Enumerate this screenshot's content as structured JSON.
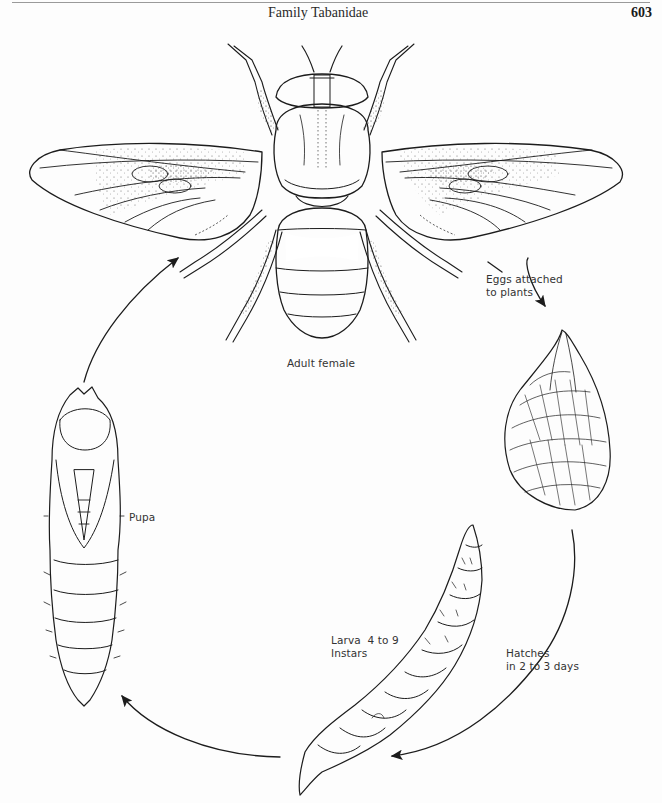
{
  "page": {
    "running_head": "Family Tabanidae",
    "page_number": "603"
  },
  "figure": {
    "stages": [
      {
        "id": "adult",
        "label": "Adult female"
      },
      {
        "id": "eggs",
        "label_lines": [
          "Eggs attached",
          "to plants"
        ]
      },
      {
        "id": "larva",
        "label_lines": [
          "Larva  4 to 9",
          "Instars"
        ]
      },
      {
        "id": "pupa",
        "label": "Pupa"
      }
    ],
    "transitions": [
      {
        "from": "adult",
        "to": "eggs",
        "label": "Eggs attached to plants"
      },
      {
        "from": "eggs",
        "to": "larva",
        "label_lines": [
          "Hatches",
          "in 2 to 3 days"
        ]
      },
      {
        "from": "larva",
        "to": "pupa",
        "label": ""
      },
      {
        "from": "pupa",
        "to": "adult",
        "label": ""
      }
    ],
    "ink_color": "#1c1c1c",
    "paper_color": "#fdfdfd"
  }
}
